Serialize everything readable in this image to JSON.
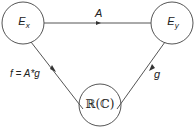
{
  "nodes": {
    "ex": {
      "label": "E",
      "sub": "x"
    },
    "ey": {
      "label": "E",
      "sub": "y"
    },
    "rc": {
      "label": "ℝ(ℂ)"
    }
  },
  "edges": {
    "top": {
      "label": "A"
    },
    "left": {
      "label": "f = A*g"
    },
    "right": {
      "label": "g"
    }
  },
  "colors": {
    "stroke": "#444444",
    "text": "#222222"
  }
}
